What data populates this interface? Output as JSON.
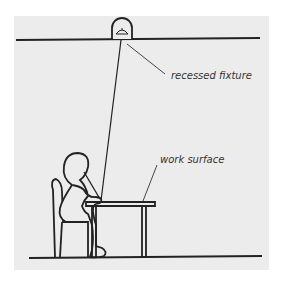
{
  "diagram": {
    "type": "section-illustration",
    "labels": {
      "fixture": "recessed fixture",
      "surface": "work surface"
    },
    "elements": [
      {
        "name": "ceiling-line"
      },
      {
        "name": "recessed-fixture"
      },
      {
        "name": "light-ray"
      },
      {
        "name": "seated-person"
      },
      {
        "name": "chair"
      },
      {
        "name": "table"
      },
      {
        "name": "floor-line"
      }
    ],
    "colors": {
      "background": "#ececec",
      "line": "#222222",
      "text": "#333333"
    }
  }
}
